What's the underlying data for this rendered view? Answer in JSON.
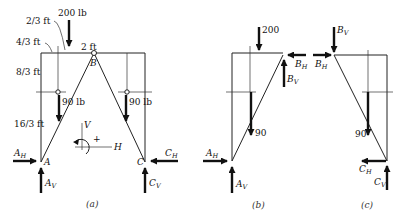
{
  "figure": {
    "panels": [
      {
        "id": "a",
        "caption": "(a)",
        "load_top": "200 lb",
        "dims": {
          "d1": "2/3 ft",
          "d2": "4/3 ft",
          "d3": "2 ft",
          "d4": "8/3 ft",
          "d5": "16/3 ft"
        },
        "loads": {
          "left": "90 lb",
          "right": "90 lb"
        },
        "points": {
          "A": "A",
          "B": "B",
          "C": "C"
        },
        "reactions": {
          "AH": {
            "main": "A",
            "sub": "H"
          },
          "AV": {
            "main": "A",
            "sub": "V"
          },
          "CH": {
            "main": "C",
            "sub": "H"
          },
          "CV": {
            "main": "C",
            "sub": "V"
          }
        },
        "axes": {
          "v": "V",
          "h": "H",
          "sign": "+"
        }
      },
      {
        "id": "b",
        "caption": "(b)",
        "load_top": "200",
        "load_mid": "90",
        "reactions": {
          "AH": {
            "main": "A",
            "sub": "H"
          },
          "AV": {
            "main": "A",
            "sub": "V"
          },
          "BH": {
            "main": "B",
            "sub": "H"
          },
          "BV": {
            "main": "B",
            "sub": "V"
          }
        }
      },
      {
        "id": "c",
        "caption": "(c)",
        "load_mid": "90",
        "reactions": {
          "BH": {
            "main": "B",
            "sub": "H"
          },
          "BV": {
            "main": "B",
            "sub": "V"
          },
          "CH": {
            "main": "C",
            "sub": "H"
          },
          "CV": {
            "main": "C",
            "sub": "V"
          }
        }
      }
    ]
  }
}
